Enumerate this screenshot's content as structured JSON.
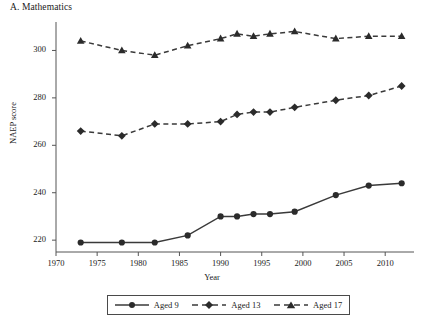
{
  "figure": {
    "panel_title": "A. Mathematics",
    "ylabel": "NAEP score",
    "xlabel": "Year"
  },
  "axes": {
    "y_ticks": [
      "220",
      "240",
      "260",
      "280",
      "300"
    ],
    "x_ticks": [
      "1970",
      "1975",
      "1980",
      "1985",
      "1990",
      "1995",
      "2000",
      "2005",
      "2010"
    ]
  },
  "legend": {
    "items": [
      {
        "label": "Aged 9",
        "marker": "circle-marker",
        "line": "solid"
      },
      {
        "label": "Aged 13",
        "marker": "diamond-marker",
        "line": "dashed"
      },
      {
        "label": "Aged 17",
        "marker": "triangle-marker",
        "line": "dashed"
      }
    ]
  },
  "colors": {
    "line": "#3a3a3a",
    "marker": "#2b2b2b",
    "axis": "#555555",
    "text": "#1a1a1a"
  },
  "chart_data": {
    "type": "line",
    "title": "A. Mathematics",
    "xlabel": "Year",
    "ylabel": "NAEP score",
    "xlim": [
      1970,
      2013.5
    ],
    "ylim": [
      215,
      312
    ],
    "grid": false,
    "legend_position": "bottom",
    "x_ticks": [
      1970,
      1975,
      1980,
      1985,
      1990,
      1995,
      2000,
      2005,
      2010
    ],
    "y_ticks": [
      220,
      240,
      260,
      280,
      300
    ],
    "series": [
      {
        "name": "Aged 9",
        "marker": "circle",
        "linestyle": "solid",
        "x": [
          1973,
          1978,
          1982,
          1986,
          1990,
          1992,
          1994,
          1996,
          1999,
          2004,
          2008,
          2012
        ],
        "values": [
          219,
          219,
          219,
          222,
          230,
          230,
          231,
          231,
          232,
          239,
          243,
          244
        ]
      },
      {
        "name": "Aged 13",
        "marker": "diamond",
        "linestyle": "dashed",
        "x": [
          1973,
          1978,
          1982,
          1986,
          1990,
          1992,
          1994,
          1996,
          1999,
          2004,
          2008,
          2012
        ],
        "values": [
          266,
          264,
          269,
          269,
          270,
          273,
          274,
          274,
          276,
          279,
          281,
          285
        ]
      },
      {
        "name": "Aged 17",
        "marker": "triangle",
        "linestyle": "dashed",
        "x": [
          1973,
          1978,
          1982,
          1986,
          1990,
          1992,
          1994,
          1996,
          1999,
          2004,
          2008,
          2012
        ],
        "values": [
          304,
          300,
          298,
          302,
          305,
          307,
          306,
          307,
          308,
          305,
          306,
          306
        ]
      }
    ]
  }
}
